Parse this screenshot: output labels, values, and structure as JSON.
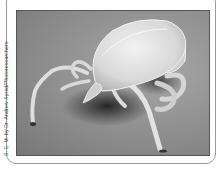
{
  "figure": {
    "image_description": "Scanning electron micrograph of a tick on a gray background",
    "credit": "S. E. M. by Dr. Andrew Syred/Photoresearchers"
  },
  "colors": {
    "background": "#8e8e8e",
    "subject": "#e6e6e6",
    "shadow": "#2a2a2a",
    "frame_border": "#9a9a9a"
  }
}
